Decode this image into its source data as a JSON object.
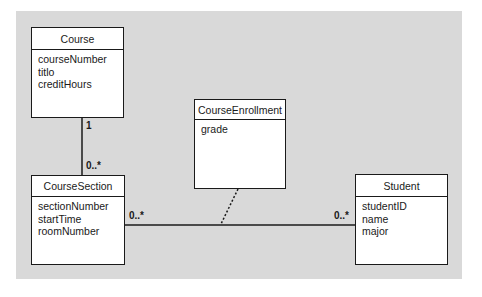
{
  "diagram": {
    "type": "UML class diagram",
    "background_color": "#d9d9d9",
    "classes": [
      {
        "id": "course",
        "name": "Course",
        "attributes": [
          "courseNumber",
          "titlo",
          "creditHours"
        ]
      },
      {
        "id": "course_section",
        "name": "CourseSection",
        "attributes": [
          "sectionNumber",
          "startTime",
          "roomNumber"
        ]
      },
      {
        "id": "course_enrollment",
        "name": "CourseEnrollment",
        "attributes": [
          "grade"
        ]
      },
      {
        "id": "student",
        "name": "Student",
        "attributes": [
          "studentID",
          "name",
          "major"
        ]
      }
    ],
    "associations": [
      {
        "from": "Course",
        "to": "CourseSection",
        "from_multiplicity": "1",
        "to_multiplicity": "0..*"
      },
      {
        "from": "CourseSection",
        "to": "Student",
        "from_multiplicity": "0..*",
        "to_multiplicity": "0..*",
        "association_class": "CourseEnrollment"
      }
    ]
  }
}
